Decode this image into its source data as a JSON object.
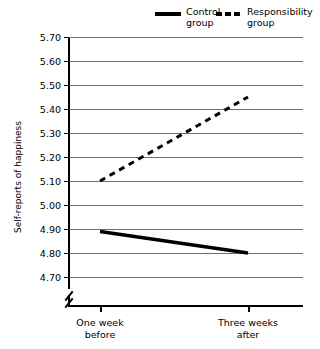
{
  "chart_data": {
    "type": "line",
    "title": "",
    "xlabel": "",
    "ylabel": "Self-reports of happiness",
    "categories": [
      "One week before",
      "Three weeks after"
    ],
    "ylim": [
      4.7,
      5.7
    ],
    "ytick_step": 0.1,
    "yticks": [
      "5.70",
      "5.60",
      "5.50",
      "5.40",
      "5.30",
      "5.20",
      "5.10",
      "5.00",
      "4.90",
      "4.80",
      "4.70"
    ],
    "grid": true,
    "y_axis_break": true,
    "legend_position": "top-right",
    "series": [
      {
        "name": "Control group",
        "style": "solid",
        "color": "#000000",
        "values": [
          4.89,
          4.8
        ]
      },
      {
        "name": "Responsibility group",
        "style": "dashed",
        "color": "#000000",
        "values": [
          5.1,
          5.45
        ]
      }
    ]
  },
  "legend": {
    "items": [
      {
        "label_line1": "Control",
        "label_line2": "group",
        "swatch": "solid-line-swatch"
      },
      {
        "label_line1": "Responsibility",
        "label_line2": "group",
        "swatch": "dashed-line-swatch"
      }
    ]
  },
  "axes": {
    "y_title": "Self-reports of happiness",
    "x_labels": [
      {
        "line1": "One week",
        "line2": "before"
      },
      {
        "line1": "Three weeks",
        "line2": "after"
      }
    ]
  }
}
